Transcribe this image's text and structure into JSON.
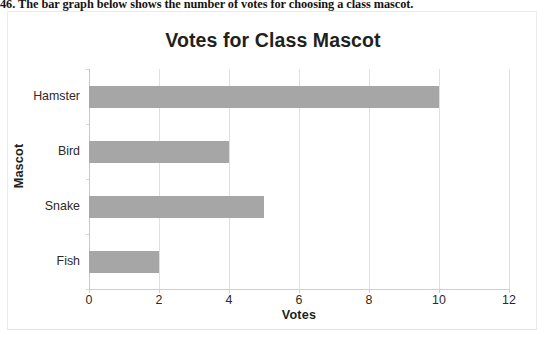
{
  "question": {
    "text": "46. The bar graph below shows the number of votes for choosing a class mascot."
  },
  "chart_data": {
    "type": "bar",
    "orientation": "horizontal",
    "title": "Votes for Class Mascot",
    "xlabel": "Votes",
    "ylabel": "Mascot",
    "categories": [
      "Hamster",
      "Bird",
      "Snake",
      "Fish"
    ],
    "values": [
      10,
      4,
      5,
      2
    ],
    "xlim": [
      0,
      12
    ],
    "xticks": [
      0,
      2,
      4,
      6,
      8,
      10,
      12
    ],
    "xtick_labels": [
      "0",
      "2",
      "4",
      "6",
      "8",
      "10",
      "12"
    ],
    "grid": true,
    "grid_axis": "x",
    "legend": false,
    "bar_color": "#a6a6a6",
    "gridline_color": "#e0e0e0",
    "text_color": "#231f1c"
  }
}
